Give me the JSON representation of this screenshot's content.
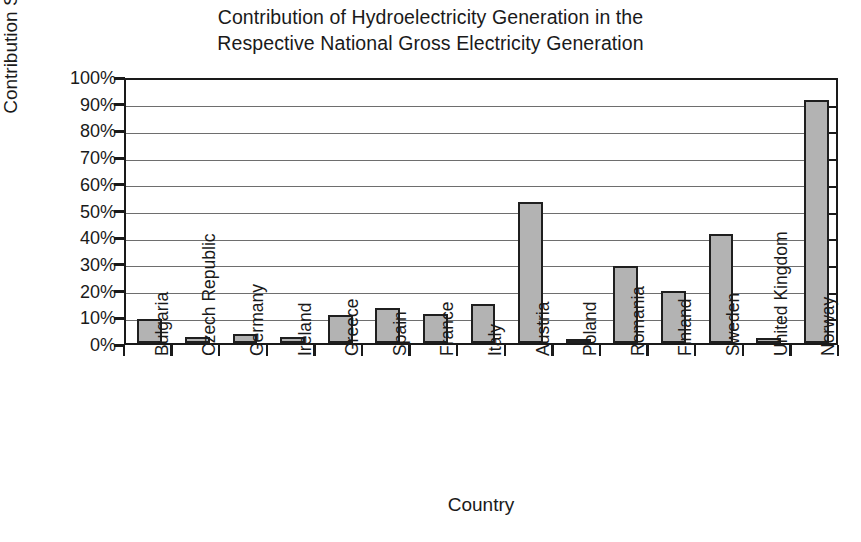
{
  "chart_data": {
    "type": "bar",
    "title": "Contribution of Hydroelectricity Generation in the Respective National Gross Electricity Generation",
    "title_lines": [
      "Contribution of Hydroelectricity Generation in the",
      "Respective National Gross Electricity Generation"
    ],
    "xlabel": "Country",
    "ylabel": "Contribution Share (2016)",
    "categories": [
      "Bulgaria",
      "Czech Republic",
      "Germany",
      "Ireland",
      "Greece",
      "Spain",
      "France",
      "Italy",
      "Austria",
      "Poland",
      "Romania",
      "Finland",
      "Sweden",
      "United Kingdom",
      "Norway"
    ],
    "values": [
      9,
      2.3,
      3.2,
      2.2,
      10.5,
      13,
      11,
      14.5,
      53,
      1.2,
      29,
      19.5,
      41,
      2,
      91
    ],
    "value_labels": [
      "9%",
      "2%",
      "3%",
      "2%",
      "11%",
      "13%",
      "11%",
      "14%",
      "53%",
      "1%",
      "29%",
      "20%",
      "41%",
      "2%",
      "91%"
    ],
    "ylim": [
      0,
      100
    ],
    "ytick_labels": [
      "100%",
      "90%",
      "80%",
      "70%",
      "60%",
      "50%",
      "40%",
      "30%",
      "20%",
      "10%",
      "0%"
    ],
    "ytick_values": [
      100,
      90,
      80,
      70,
      60,
      50,
      40,
      30,
      20,
      10,
      0
    ],
    "grid": true,
    "legend": false,
    "bar_color": "#b3b3b3",
    "bar_edge_color": "#1f1f1f",
    "axis_color": "#1a1a1a",
    "grid_color": "#6e6e6e"
  }
}
